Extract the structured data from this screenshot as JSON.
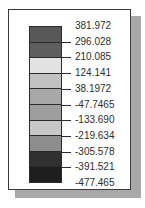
{
  "legend": {
    "title": "",
    "orientation": "vertical",
    "tick_labels": [
      "381.972",
      "296.028",
      "210.085",
      "124.141",
      "38.1972",
      "-47.7465",
      "-133.690",
      "-219.634",
      "-305.578",
      "-391.521",
      "-477.465"
    ],
    "band_colors": [
      "#585858",
      "#5e5e5e",
      "#e2e2e2",
      "#c2c2c2",
      "#a8a8a8",
      "#9e9e9e",
      "#c8c8c8",
      "#8e8e8e",
      "#303030",
      "#1e1e1e"
    ],
    "frame_color": "#3b3b3b",
    "shadow_color": "#a8a8a8",
    "text_color": "#2e2e2e",
    "background": "#ffffff"
  },
  "chart_data": {
    "type": "heatmap",
    "title": "",
    "subtitle": "",
    "xlabel": "",
    "ylabel": "",
    "legend_position": "standalone",
    "grid": false,
    "colorbar": {
      "orientation": "vertical",
      "n_bands": 10,
      "vmin": -477.465,
      "vmax": 381.972,
      "step": 85.9435,
      "tick_values": [
        381.972,
        296.028,
        210.085,
        124.141,
        38.1972,
        -47.7465,
        -133.69,
        -219.634,
        -305.578,
        -391.521,
        -477.465
      ],
      "tick_labels": [
        "381.972",
        "296.028",
        "210.085",
        "124.141",
        "38.1972",
        "-47.7465",
        "-133.690",
        "-219.634",
        "-305.578",
        "-391.521",
        "-477.465"
      ],
      "band_intervals": [
        {
          "from": 296.028,
          "to": 381.972,
          "color": "#585858"
        },
        {
          "from": 210.085,
          "to": 296.028,
          "color": "#5e5e5e"
        },
        {
          "from": 124.141,
          "to": 210.085,
          "color": "#e2e2e2"
        },
        {
          "from": 38.1972,
          "to": 124.141,
          "color": "#c2c2c2"
        },
        {
          "from": -47.7465,
          "to": 38.1972,
          "color": "#a8a8a8"
        },
        {
          "from": -133.69,
          "to": -47.7465,
          "color": "#9e9e9e"
        },
        {
          "from": -219.634,
          "to": -133.69,
          "color": "#c8c8c8"
        },
        {
          "from": -305.578,
          "to": -219.634,
          "color": "#8e8e8e"
        },
        {
          "from": -391.521,
          "to": -305.578,
          "color": "#303030"
        },
        {
          "from": -477.465,
          "to": -391.521,
          "color": "#1e1e1e"
        }
      ]
    }
  }
}
